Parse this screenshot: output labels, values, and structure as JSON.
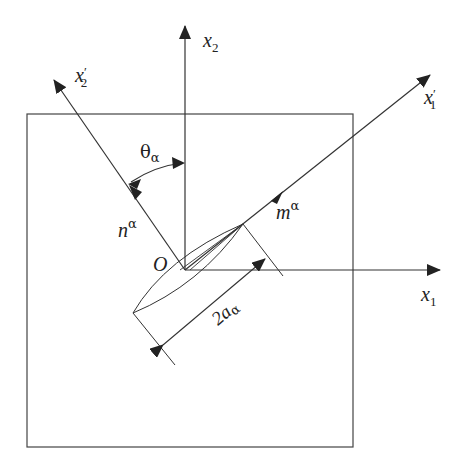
{
  "diagram": {
    "labels": {
      "x1": "x",
      "x1_sub": "1",
      "x2": "x",
      "x2_sub": "2",
      "x1_prime": "x",
      "x1_prime_mark": "′",
      "x1_prime_sub": "1",
      "x2_prime": "x",
      "x2_prime_mark": "′",
      "x2_prime_sub": "2",
      "origin": "O",
      "theta": "θ",
      "theta_sub": "α",
      "normal": "n",
      "normal_sup": "α",
      "tangent": "m",
      "tangent_sup": "α",
      "length": "2a",
      "length_sub": "α"
    },
    "colors": {
      "stroke": "#333333",
      "background": "#ffffff"
    }
  }
}
